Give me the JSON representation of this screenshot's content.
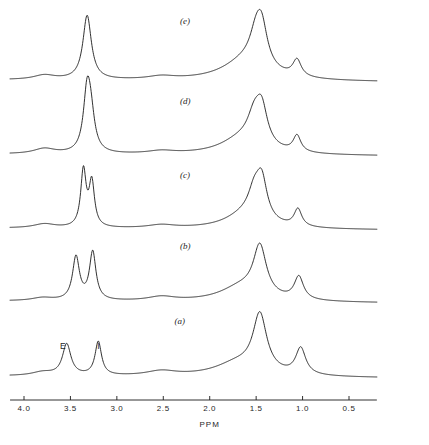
{
  "figure": {
    "background_color": "#ffffff",
    "trace_color": "#1a1a1a"
  },
  "axis": {
    "title": "PPM",
    "direction": "decreasing-left-to-right",
    "x_min_ppm": 0.2,
    "x_max_ppm": 4.15,
    "tick_labels": [
      "4.0",
      "3.5",
      "3.0",
      "2.5",
      "2.0",
      "1.5",
      "1.0",
      "0.5"
    ],
    "tick_values": [
      4.0,
      3.5,
      3.0,
      2.5,
      2.0,
      1.5,
      1.0,
      0.5
    ]
  },
  "panels": [
    {
      "id": "e",
      "label": "(e)",
      "label_ppm": 2.32
    },
    {
      "id": "d",
      "label": "(d)",
      "label_ppm": 2.32
    },
    {
      "id": "c",
      "label": "(c)",
      "label_ppm": 2.32
    },
    {
      "id": "b",
      "label": "(b)",
      "label_ppm": 2.32
    },
    {
      "id": "a",
      "label": "(a)",
      "label_ppm": 2.38
    }
  ],
  "peak_labels": [
    {
      "text": "E",
      "ppm": 3.58,
      "panel": "a"
    },
    {
      "text": "I",
      "ppm": 3.18,
      "panel": "a"
    }
  ],
  "chart_data": {
    "type": "line",
    "xlabel": "PPM",
    "ylabel": "",
    "xlim": [
      4.15,
      0.2
    ],
    "x_reversed": true,
    "grid": false,
    "legend": "none",
    "annotations": [
      {
        "text": "E",
        "x": 3.58,
        "series": "a"
      },
      {
        "text": "I",
        "x": 3.18,
        "series": "a"
      },
      {
        "text": "(a)",
        "x": 2.38,
        "series": "a"
      },
      {
        "text": "(b)",
        "x": 2.32,
        "series": "b"
      },
      {
        "text": "(c)",
        "x": 2.32,
        "series": "c"
      },
      {
        "text": "(d)",
        "x": 2.32,
        "series": "d"
      },
      {
        "text": "(e)",
        "x": 2.32,
        "series": "e"
      }
    ],
    "series": [
      {
        "name": "e",
        "baseline_slope": true,
        "peaks": [
          {
            "ppm": 3.78,
            "height": 0.07,
            "width": 0.14
          },
          {
            "ppm": 3.32,
            "height": 1.0,
            "width": 0.055
          },
          {
            "ppm": 2.52,
            "height": 0.05,
            "width": 0.18
          },
          {
            "ppm": 1.62,
            "height": 0.3,
            "width": 0.3
          },
          {
            "ppm": 1.5,
            "height": 0.44,
            "width": 0.085
          },
          {
            "ppm": 1.44,
            "height": 0.56,
            "width": 0.075
          },
          {
            "ppm": 1.06,
            "height": 0.26,
            "width": 0.055
          }
        ]
      },
      {
        "name": "d",
        "baseline_slope": true,
        "peaks": [
          {
            "ppm": 3.78,
            "height": 0.09,
            "width": 0.14
          },
          {
            "ppm": 3.32,
            "height": 1.0,
            "width": 0.048
          },
          {
            "ppm": 3.28,
            "height": 0.52,
            "width": 0.05
          },
          {
            "ppm": 2.52,
            "height": 0.05,
            "width": 0.18
          },
          {
            "ppm": 1.66,
            "height": 0.26,
            "width": 0.28
          },
          {
            "ppm": 1.52,
            "height": 0.46,
            "width": 0.09
          },
          {
            "ppm": 1.44,
            "height": 0.6,
            "width": 0.075
          },
          {
            "ppm": 1.06,
            "height": 0.28,
            "width": 0.05
          }
        ]
      },
      {
        "name": "c",
        "baseline_slope": true,
        "peaks": [
          {
            "ppm": 3.78,
            "height": 0.07,
            "width": 0.14
          },
          {
            "ppm": 3.36,
            "height": 0.97,
            "width": 0.035
          },
          {
            "ppm": 3.27,
            "height": 0.76,
            "width": 0.035
          },
          {
            "ppm": 2.52,
            "height": 0.055,
            "width": 0.18
          },
          {
            "ppm": 1.62,
            "height": 0.24,
            "width": 0.26
          },
          {
            "ppm": 1.52,
            "height": 0.42,
            "width": 0.08
          },
          {
            "ppm": 1.44,
            "height": 0.66,
            "width": 0.07
          },
          {
            "ppm": 1.05,
            "height": 0.3,
            "width": 0.05
          }
        ]
      },
      {
        "name": "b",
        "baseline_slope": true,
        "peaks": [
          {
            "ppm": 3.8,
            "height": 0.05,
            "width": 0.14
          },
          {
            "ppm": 3.44,
            "height": 0.72,
            "width": 0.045
          },
          {
            "ppm": 3.26,
            "height": 0.8,
            "width": 0.042
          },
          {
            "ppm": 2.52,
            "height": 0.07,
            "width": 0.18
          },
          {
            "ppm": 1.66,
            "height": 0.24,
            "width": 0.28
          },
          {
            "ppm": 1.46,
            "height": 0.82,
            "width": 0.085
          },
          {
            "ppm": 1.04,
            "height": 0.38,
            "width": 0.06
          }
        ]
      },
      {
        "name": "a",
        "baseline_slope": true,
        "peaks": [
          {
            "ppm": 3.8,
            "height": 0.06,
            "width": 0.14
          },
          {
            "ppm": 3.54,
            "height": 0.52,
            "width": 0.055
          },
          {
            "ppm": 3.2,
            "height": 0.56,
            "width": 0.042
          },
          {
            "ppm": 2.52,
            "height": 0.08,
            "width": 0.2
          },
          {
            "ppm": 1.7,
            "height": 0.22,
            "width": 0.3
          },
          {
            "ppm": 1.46,
            "height": 0.95,
            "width": 0.09
          },
          {
            "ppm": 1.02,
            "height": 0.44,
            "width": 0.065
          }
        ]
      }
    ]
  }
}
